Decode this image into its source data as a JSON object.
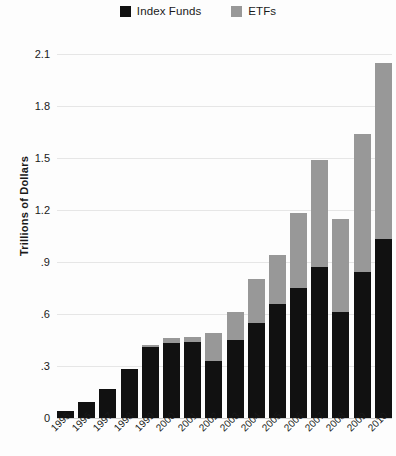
{
  "chart_data": {
    "type": "bar",
    "subtype": "stacked-vertical",
    "title": "",
    "xlabel": "",
    "ylabel": "Trillions of Dollars",
    "ylim": [
      0,
      2.1
    ],
    "yticks": [
      "0",
      ".3",
      ".6",
      ".9",
      "1.2",
      "1.5",
      "1.8",
      "2.1"
    ],
    "ytick_values": [
      0,
      0.3,
      0.6,
      0.9,
      1.2,
      1.5,
      1.8,
      2.1
    ],
    "grid": true,
    "legend_position": "top-center",
    "categories": [
      "1995",
      "1996",
      "1997",
      "1998",
      "1999",
      "2000",
      "2001",
      "2002",
      "2003",
      "2004",
      "2005",
      "2006",
      "2007",
      "2008",
      "2009",
      "2010"
    ],
    "series": [
      {
        "name": "Index Funds",
        "color": "#111111",
        "values": [
          0.04,
          0.09,
          0.17,
          0.28,
          0.41,
          0.43,
          0.44,
          0.33,
          0.45,
          0.55,
          0.66,
          0.75,
          0.87,
          0.61,
          0.84,
          1.03
        ]
      },
      {
        "name": "ETFs",
        "color": "#989898",
        "values": [
          0.0,
          0.0,
          0.0,
          0.0,
          0.01,
          0.03,
          0.03,
          0.16,
          0.16,
          0.25,
          0.28,
          0.43,
          0.62,
          0.54,
          0.8,
          1.02
        ]
      }
    ],
    "totals": [
      0.04,
      0.09,
      0.17,
      0.28,
      0.42,
      0.46,
      0.47,
      0.49,
      0.61,
      0.8,
      0.94,
      1.18,
      1.49,
      1.15,
      1.64,
      2.05
    ]
  },
  "legend": {
    "items": [
      {
        "label": "Index Funds",
        "color": "#111111"
      },
      {
        "label": "ETFs",
        "color": "#989898"
      }
    ]
  }
}
